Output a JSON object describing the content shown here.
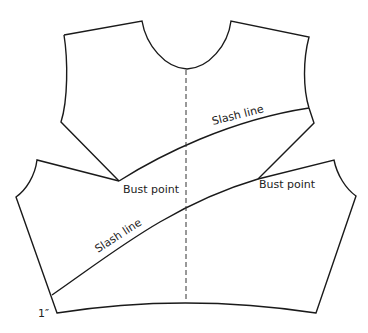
{
  "diagram": {
    "type": "sewing-pattern",
    "labels": {
      "upper_slash": "Slash line",
      "lower_slash": "Slash line",
      "bust_left": "Bust point",
      "bust_right": "Bust point",
      "measurement": "1″"
    },
    "colors": {
      "stroke": "#1a1a1a",
      "background": "#ffffff",
      "text": "#222222"
    },
    "pieces": [
      {
        "name": "upper-bodice",
        "description": "shoulders, neckline and armholes down to the upper slash line and bust points"
      },
      {
        "name": "lower-bodice",
        "description": "lower front section spread open below the bust points with a curved waistline"
      }
    ],
    "center_front": {
      "style": "dashed"
    }
  }
}
